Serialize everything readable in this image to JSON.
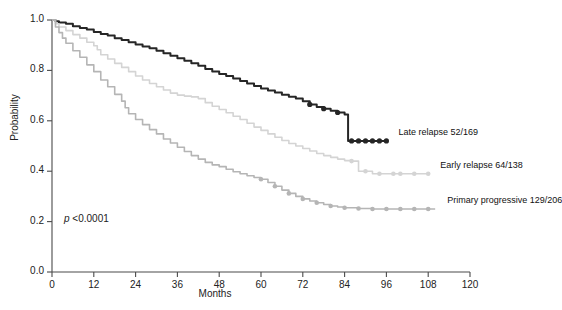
{
  "chart_data": {
    "type": "line",
    "title": "",
    "xlabel": "Months",
    "ylabel": "Probability",
    "xlim": [
      0,
      120
    ],
    "ylim": [
      0,
      1.0
    ],
    "xticks": [
      "0",
      "12",
      "24",
      "36",
      "48",
      "60",
      "72",
      "84",
      "96",
      "108",
      "120"
    ],
    "xtick_values": [
      0,
      12,
      24,
      36,
      48,
      60,
      72,
      84,
      96,
      108,
      120
    ],
    "yticks": [
      "0.0",
      "0.2",
      "0.4",
      "0.6",
      "0.8",
      "1.0"
    ],
    "ytick_values": [
      0.0,
      0.2,
      0.4,
      0.6,
      0.8,
      1.0
    ],
    "grid": false,
    "legend_position": "right-inline",
    "annotation": "p <0.0001",
    "annotation_p": "p",
    "annotation_rest": " <0.0001",
    "series": [
      {
        "name": "Late relapse",
        "label": "Late relapse  52/169",
        "events": "52",
        "total": "169",
        "color": "#262626",
        "final_probability": 0.52,
        "max_month": 96,
        "points": [
          [
            0,
            1.0
          ],
          [
            1,
            0.995
          ],
          [
            2,
            0.99
          ],
          [
            4,
            0.985
          ],
          [
            6,
            0.975
          ],
          [
            8,
            0.968
          ],
          [
            10,
            0.962
          ],
          [
            12,
            0.952
          ],
          [
            14,
            0.944
          ],
          [
            16,
            0.938
          ],
          [
            18,
            0.928
          ],
          [
            20,
            0.921
          ],
          [
            22,
            0.912
          ],
          [
            24,
            0.903
          ],
          [
            26,
            0.895
          ],
          [
            28,
            0.888
          ],
          [
            30,
            0.878
          ],
          [
            32,
            0.868
          ],
          [
            34,
            0.858
          ],
          [
            36,
            0.848
          ],
          [
            38,
            0.838
          ],
          [
            40,
            0.828
          ],
          [
            42,
            0.818
          ],
          [
            44,
            0.806
          ],
          [
            46,
            0.796
          ],
          [
            48,
            0.786
          ],
          [
            50,
            0.778
          ],
          [
            52,
            0.768
          ],
          [
            54,
            0.758
          ],
          [
            56,
            0.748
          ],
          [
            58,
            0.738
          ],
          [
            60,
            0.728
          ],
          [
            62,
            0.72
          ],
          [
            64,
            0.712
          ],
          [
            66,
            0.703
          ],
          [
            68,
            0.695
          ],
          [
            70,
            0.688
          ],
          [
            72,
            0.678
          ],
          [
            74,
            0.665
          ],
          [
            76,
            0.655
          ],
          [
            78,
            0.648
          ],
          [
            80,
            0.64
          ],
          [
            82,
            0.633
          ],
          [
            84,
            0.625
          ],
          [
            85,
            0.52
          ],
          [
            88,
            0.52
          ],
          [
            92,
            0.52
          ],
          [
            96,
            0.52
          ]
        ],
        "censor_months": [
          74,
          78,
          82,
          86,
          88,
          90,
          92,
          94,
          96
        ]
      },
      {
        "name": "Early relapse",
        "label": "Early relapse 64/138",
        "events": "64",
        "total": "138",
        "color": "#d4d4d4",
        "final_probability": 0.39,
        "max_month": 108,
        "points": [
          [
            0,
            1.0
          ],
          [
            1,
            0.985
          ],
          [
            2,
            0.972
          ],
          [
            4,
            0.958
          ],
          [
            6,
            0.942
          ],
          [
            8,
            0.928
          ],
          [
            10,
            0.912
          ],
          [
            12,
            0.898
          ],
          [
            13,
            0.882
          ],
          [
            14,
            0.862
          ],
          [
            16,
            0.845
          ],
          [
            18,
            0.828
          ],
          [
            20,
            0.812
          ],
          [
            22,
            0.795
          ],
          [
            24,
            0.778
          ],
          [
            26,
            0.762
          ],
          [
            28,
            0.748
          ],
          [
            30,
            0.735
          ],
          [
            32,
            0.722
          ],
          [
            34,
            0.71
          ],
          [
            36,
            0.702
          ],
          [
            38,
            0.698
          ],
          [
            40,
            0.695
          ],
          [
            42,
            0.688
          ],
          [
            44,
            0.672
          ],
          [
            46,
            0.658
          ],
          [
            48,
            0.645
          ],
          [
            50,
            0.632
          ],
          [
            52,
            0.618
          ],
          [
            54,
            0.605
          ],
          [
            56,
            0.59
          ],
          [
            58,
            0.575
          ],
          [
            60,
            0.562
          ],
          [
            62,
            0.548
          ],
          [
            64,
            0.535
          ],
          [
            66,
            0.522
          ],
          [
            68,
            0.51
          ],
          [
            70,
            0.5
          ],
          [
            72,
            0.49
          ],
          [
            74,
            0.48
          ],
          [
            76,
            0.47
          ],
          [
            78,
            0.462
          ],
          [
            80,
            0.455
          ],
          [
            82,
            0.448
          ],
          [
            84,
            0.442
          ],
          [
            86,
            0.44
          ],
          [
            88,
            0.4
          ],
          [
            92,
            0.39
          ],
          [
            96,
            0.39
          ],
          [
            100,
            0.39
          ],
          [
            104,
            0.39
          ],
          [
            108,
            0.39
          ]
        ],
        "censor_months": [
          86,
          90,
          94,
          98,
          100,
          104,
          108
        ]
      },
      {
        "name": "Primary progressive",
        "label": "Primary progressive 129/206",
        "events": "129",
        "total": "206",
        "color": "#b5b5b5",
        "final_probability": 0.25,
        "max_month": 110,
        "points": [
          [
            0,
            1.0
          ],
          [
            1,
            0.972
          ],
          [
            2,
            0.95
          ],
          [
            3,
            0.928
          ],
          [
            4,
            0.908
          ],
          [
            6,
            0.878
          ],
          [
            8,
            0.852
          ],
          [
            10,
            0.822
          ],
          [
            12,
            0.795
          ],
          [
            14,
            0.762
          ],
          [
            16,
            0.735
          ],
          [
            18,
            0.705
          ],
          [
            20,
            0.678
          ],
          [
            21,
            0.652
          ],
          [
            22,
            0.628
          ],
          [
            24,
            0.605
          ],
          [
            26,
            0.585
          ],
          [
            28,
            0.565
          ],
          [
            30,
            0.548
          ],
          [
            32,
            0.528
          ],
          [
            34,
            0.512
          ],
          [
            36,
            0.495
          ],
          [
            38,
            0.478
          ],
          [
            40,
            0.462
          ],
          [
            42,
            0.448
          ],
          [
            44,
            0.435
          ],
          [
            46,
            0.425
          ],
          [
            48,
            0.418
          ],
          [
            50,
            0.408
          ],
          [
            52,
            0.398
          ],
          [
            54,
            0.39
          ],
          [
            56,
            0.382
          ],
          [
            58,
            0.375
          ],
          [
            60,
            0.368
          ],
          [
            62,
            0.355
          ],
          [
            64,
            0.34
          ],
          [
            66,
            0.325
          ],
          [
            68,
            0.312
          ],
          [
            70,
            0.3
          ],
          [
            72,
            0.29
          ],
          [
            74,
            0.282
          ],
          [
            76,
            0.275
          ],
          [
            78,
            0.268
          ],
          [
            80,
            0.262
          ],
          [
            82,
            0.258
          ],
          [
            84,
            0.255
          ],
          [
            88,
            0.252
          ],
          [
            92,
            0.25
          ],
          [
            96,
            0.25
          ],
          [
            100,
            0.25
          ],
          [
            104,
            0.25
          ],
          [
            108,
            0.25
          ],
          [
            110,
            0.25
          ]
        ],
        "censor_months": [
          60,
          64,
          68,
          72,
          76,
          80,
          84,
          88,
          92,
          96,
          100,
          104,
          108
        ]
      }
    ]
  },
  "axes": {
    "ylabel": "Probability",
    "xlabel": "Months"
  },
  "annotation": {
    "p_italic": "p",
    "p_rest": " <0.0001"
  }
}
